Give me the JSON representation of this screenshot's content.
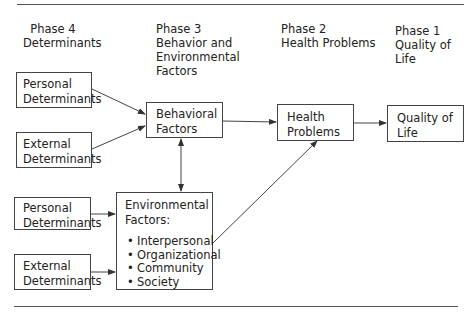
{
  "phases": [
    {
      "line1": "Phase 4",
      "line2": "Determinants",
      "line3": "",
      "line4": ""
    },
    {
      "line1": "Phase 3",
      "line2": "Behavior and",
      "line3": "Environmental",
      "line4": "Factors"
    },
    {
      "line1": "Phase 2",
      "line2": "Health Problems",
      "line3": "",
      "line4": ""
    },
    {
      "line1": "Phase 1",
      "line2": "Quality of Life",
      "line3": "",
      "line4": ""
    }
  ],
  "boxes": {
    "personal_top": {
      "line1": "Personal",
      "line2": "Determinants"
    },
    "external_top": {
      "line1": "External",
      "line2": "Determinants"
    },
    "behavioral": {
      "line1": "Behavioral",
      "line2": "Factors"
    },
    "health": {
      "line1": "Health",
      "line2": "Problems"
    },
    "quality": {
      "line1": "Quality of",
      "line2": "Life"
    },
    "personal_bottom": {
      "line1": "Personal",
      "line2": "Determinants"
    },
    "external_bottom": {
      "line1": "External",
      "line2": "Determinants"
    },
    "environmental": {
      "line1": "Environmental",
      "line2": "Factors:",
      "items": [
        "Interpersonal",
        "Organizational",
        "Community",
        "Society"
      ]
    }
  },
  "edges": [
    {
      "from": "personal_top",
      "to": "behavioral"
    },
    {
      "from": "external_top",
      "to": "behavioral"
    },
    {
      "from": "behavioral",
      "to": "environmental",
      "bidirectional": true
    },
    {
      "from": "behavioral",
      "to": "health"
    },
    {
      "from": "health",
      "to": "quality"
    },
    {
      "from": "personal_bottom",
      "to": "environmental"
    },
    {
      "from": "external_bottom",
      "to": "environmental"
    },
    {
      "from": "environmental",
      "to": "health"
    }
  ],
  "colors": {
    "line": "#444444",
    "text": "#222222",
    "background": "#ffffff"
  }
}
